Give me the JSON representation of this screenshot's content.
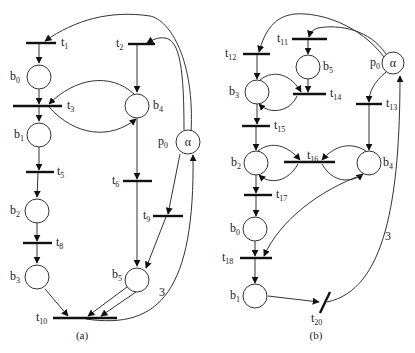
{
  "figure": {
    "panels": [
      {
        "id": "a",
        "caption": "(a)",
        "places": [
          {
            "id": "b0",
            "label": "b",
            "sub": "0"
          },
          {
            "id": "b1",
            "label": "b",
            "sub": "1"
          },
          {
            "id": "b2",
            "label": "b",
            "sub": "2"
          },
          {
            "id": "b3",
            "label": "b",
            "sub": "3"
          },
          {
            "id": "b4",
            "label": "b",
            "sub": "4"
          },
          {
            "id": "b5",
            "label": "b",
            "sub": "5"
          },
          {
            "id": "p0",
            "label": "p",
            "sub": "0",
            "token": "α"
          }
        ],
        "transitions": [
          {
            "id": "t1",
            "label": "t",
            "sub": "1"
          },
          {
            "id": "t2",
            "label": "t",
            "sub": "2"
          },
          {
            "id": "t3",
            "label": "t",
            "sub": "3"
          },
          {
            "id": "t5",
            "label": "t",
            "sub": "5"
          },
          {
            "id": "t6",
            "label": "t",
            "sub": "6"
          },
          {
            "id": "t8",
            "label": "t",
            "sub": "8"
          },
          {
            "id": "t9",
            "label": "t",
            "sub": "9"
          },
          {
            "id": "t10",
            "label": "t",
            "sub": "10"
          }
        ],
        "arc_weight": "3"
      },
      {
        "id": "b",
        "caption": "(b)",
        "places": [
          {
            "id": "b0",
            "label": "b",
            "sub": "0"
          },
          {
            "id": "b1",
            "label": "b",
            "sub": "1"
          },
          {
            "id": "b2",
            "label": "b",
            "sub": "2"
          },
          {
            "id": "b3",
            "label": "b",
            "sub": "3"
          },
          {
            "id": "b4",
            "label": "b",
            "sub": "4"
          },
          {
            "id": "b5",
            "label": "b",
            "sub": "5"
          },
          {
            "id": "p0",
            "label": "p",
            "sub": "0",
            "token": "α"
          }
        ],
        "transitions": [
          {
            "id": "t11",
            "label": "t",
            "sub": "11"
          },
          {
            "id": "t12",
            "label": "t",
            "sub": "12"
          },
          {
            "id": "t13",
            "label": "t",
            "sub": "13"
          },
          {
            "id": "t14",
            "label": "t",
            "sub": "14"
          },
          {
            "id": "t15",
            "label": "t",
            "sub": "15"
          },
          {
            "id": "t16",
            "label": "t",
            "sub": "16"
          },
          {
            "id": "t17",
            "label": "t",
            "sub": "17"
          },
          {
            "id": "t18",
            "label": "t",
            "sub": "18"
          },
          {
            "id": "t20",
            "label": "t",
            "sub": "20"
          }
        ],
        "arc_weight": "3"
      }
    ]
  }
}
